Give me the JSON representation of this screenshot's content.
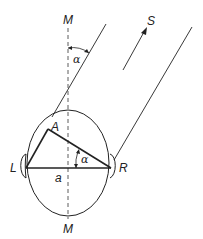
{
  "diagram": {
    "labels": {
      "median_top": "M",
      "median_bottom": "M",
      "source": "S",
      "angle_top": "α",
      "angle_inner": "α",
      "point_a": "A",
      "left_ear": "L",
      "right_ear": "R",
      "baseline": "a"
    },
    "colors": {
      "stroke": "#222222",
      "background": "#ffffff"
    }
  }
}
